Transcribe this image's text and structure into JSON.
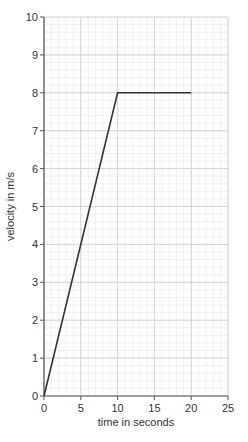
{
  "chart_data": {
    "type": "line",
    "title": "",
    "xlabel": "time in seconds",
    "ylabel": "velocity in m/s",
    "xlim": [
      0,
      25
    ],
    "ylim": [
      0,
      10
    ],
    "x_ticks": [
      0,
      5,
      10,
      15,
      20,
      25
    ],
    "y_ticks": [
      0,
      1,
      2,
      3,
      4,
      5,
      6,
      7,
      8,
      9,
      10
    ],
    "x_tick_labels": [
      "0",
      "5",
      "10",
      "15",
      "20",
      "25"
    ],
    "y_tick_labels": [
      "0",
      "1",
      "2",
      "3",
      "4",
      "5",
      "6",
      "7",
      "8",
      "9",
      "10"
    ],
    "grid": true,
    "minor_grid": {
      "x_step": 1,
      "y_step": 0.2
    },
    "legend": null,
    "series": [
      {
        "name": "velocity",
        "x": [
          0,
          10,
          20
        ],
        "y": [
          0,
          8,
          8
        ],
        "color": "#333333"
      }
    ]
  },
  "layout": {
    "plot": {
      "left": 44,
      "top": 17,
      "right": 228,
      "bottom": 396
    },
    "colors": {
      "major_grid": "#d4d4d4",
      "minor_grid": "#ececec",
      "axis": "#555555",
      "line": "#333333"
    }
  }
}
